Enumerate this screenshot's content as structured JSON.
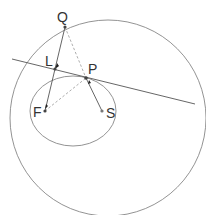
{
  "diagram": {
    "labels": {
      "Q": "Q",
      "L": "L",
      "P": "P",
      "F": "F",
      "S": "S"
    },
    "points": {
      "Q": [
        65,
        27
      ],
      "L": [
        55,
        69
      ],
      "P": [
        86,
        78
      ],
      "F": [
        45,
        111
      ],
      "S": [
        102,
        111
      ]
    },
    "shapes": {
      "large_circle": {
        "cx": 108,
        "cy": 118,
        "r": 98
      },
      "ellipse": {
        "cx": 73,
        "cy": 111,
        "rx": 43,
        "ry": 35
      },
      "tangent_line": {
        "x1": 12,
        "y1": 59,
        "x2": 195,
        "y2": 104
      }
    },
    "colors": {
      "stroke": "#555555",
      "dashed": "#999999",
      "point": "#333333"
    }
  }
}
